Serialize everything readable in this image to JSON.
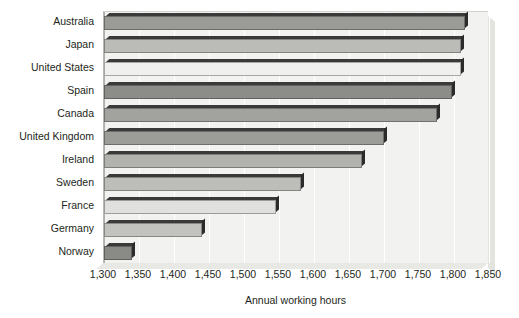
{
  "chart_data": {
    "type": "bar",
    "orientation": "horizontal",
    "title": "Average annual hours worked per person",
    "xlabel": "Annual working hours",
    "ylabel": "",
    "categories": [
      "Australia",
      "Japan",
      "United States",
      "Spain",
      "Canada",
      "United Kingdom",
      "Ireland",
      "Sweden",
      "France",
      "Germany",
      "Norway"
    ],
    "values": [
      1815,
      1810,
      1810,
      1797,
      1775,
      1700,
      1668,
      1581,
      1545,
      1440,
      1340
    ],
    "xlim": [
      1300,
      1850
    ],
    "xticks": [
      1300,
      1350,
      1400,
      1450,
      1500,
      1550,
      1600,
      1650,
      1700,
      1750,
      1800,
      1850
    ],
    "xtick_labels": [
      "1,300",
      "1,350",
      "1,400",
      "1,450",
      "1,500",
      "1,550",
      "1,600",
      "1,650",
      "1,700",
      "1,750",
      "1,800",
      "1,850"
    ],
    "grid": true,
    "legend": false,
    "bar_colors": [
      "#9a9a96",
      "#b8b8b4",
      "#ececea",
      "#8e8e8a",
      "#a0a0 9c",
      "#9c9c98",
      "#b0b0ac",
      "#bcbcb8",
      "#dcdcda",
      "#bfbfbb",
      "#8a8a86"
    ],
    "plot_background": "#f2f2f0",
    "text_color": "#231f20"
  },
  "bars": [
    {
      "label": "Australia",
      "value": 1815,
      "color": "#9b9b97"
    },
    {
      "label": "Japan",
      "value": 1810,
      "color": "#bbbbb7"
    },
    {
      "label": "United States",
      "value": 1810,
      "color": "#f0f0ee"
    },
    {
      "label": "Spain",
      "value": 1797,
      "color": "#8c8c88"
    },
    {
      "label": "Canada",
      "value": 1775,
      "color": "#a2a29e"
    },
    {
      "label": "United Kingdom",
      "value": 1700,
      "color": "#9c9c98"
    },
    {
      "label": "Ireland",
      "value": 1668,
      "color": "#b2b2ae"
    },
    {
      "label": "Sweden",
      "value": 1581,
      "color": "#bdbdb9"
    },
    {
      "label": "France",
      "value": 1545,
      "color": "#e0e0de"
    },
    {
      "label": "Germany",
      "value": 1440,
      "color": "#c2c2be"
    },
    {
      "label": "Norway",
      "value": 1340,
      "color": "#8a8a86"
    }
  ]
}
